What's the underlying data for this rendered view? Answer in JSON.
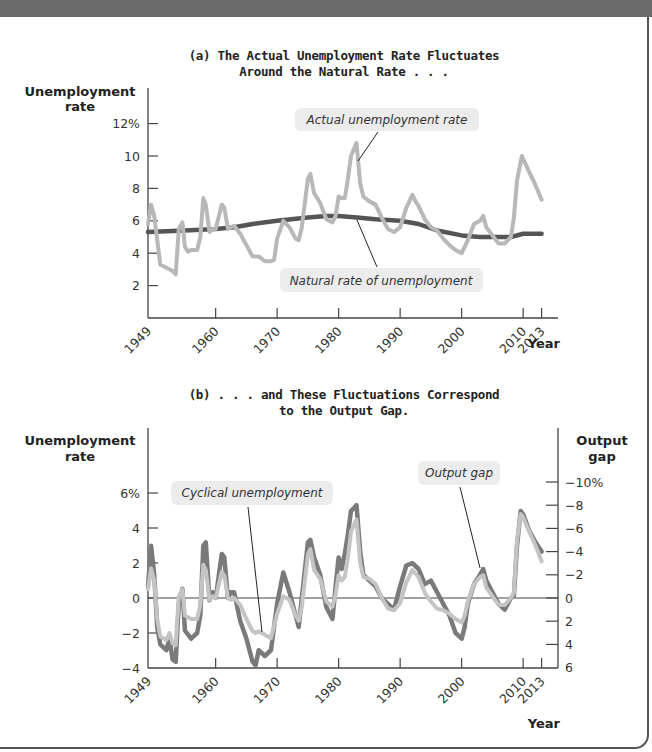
{
  "chart_data": [
    {
      "type": "line",
      "title": "(a) The Actual Unemployment Rate Fluctuates Around the Natural Rate . . .",
      "title_lines": [
        "(a) The Actual Unemployment Rate Fluctuates",
        "Around the Natural Rate . . ."
      ],
      "ylabel_lines": [
        "Unemployment",
        "rate"
      ],
      "xlabel": "Year",
      "ylim": [
        0,
        13
      ],
      "yticks": [
        {
          "v": 12,
          "label": "12%"
        },
        {
          "v": 10,
          "label": "10"
        },
        {
          "v": 8,
          "label": "8"
        },
        {
          "v": 6,
          "label": "6"
        },
        {
          "v": 4,
          "label": "4"
        },
        {
          "v": 2,
          "label": "2"
        }
      ],
      "xticks": [
        1949,
        1960,
        1970,
        1980,
        1990,
        2000,
        2010,
        2013
      ],
      "xlim": [
        1949,
        2015
      ],
      "annotations": [
        {
          "text": "Actual unemployment rate",
          "series": "actual"
        },
        {
          "text": "Natural rate of unemployment",
          "series": "natural"
        }
      ],
      "series": [
        {
          "name": "Actual unemployment rate",
          "key": "actual",
          "color": "#b8b8b8",
          "x": [
            1949,
            1949.5,
            1950,
            1950.7,
            1951,
            1952,
            1953,
            1953.5,
            1954,
            1954.6,
            1955,
            1955.5,
            1956,
            1957,
            1957.5,
            1958,
            1958.4,
            1959,
            1959.5,
            1960,
            1961,
            1961.4,
            1962,
            1962.5,
            1963,
            1964,
            1965,
            1966,
            1967,
            1968,
            1969,
            1969.5,
            1970,
            1971,
            1972,
            1973,
            1973.5,
            1974,
            1975,
            1975.4,
            1976,
            1977,
            1978,
            1979,
            1979.5,
            1980,
            1980.5,
            1981,
            1981.5,
            1982,
            1982.9,
            1983.5,
            1984,
            1985,
            1986,
            1987,
            1988,
            1989,
            1990,
            1991,
            1992,
            1992.5,
            1993,
            1994,
            1995,
            1996,
            1997,
            1998,
            1999,
            2000,
            2001,
            2002,
            2003,
            2003.5,
            2004,
            2005,
            2006,
            2007,
            2008,
            2008.5,
            2009,
            2009.8,
            2010,
            2011,
            2012,
            2013
          ],
          "y": [
            5.8,
            7.0,
            6.3,
            4.2,
            3.3,
            3.1,
            2.9,
            2.7,
            5.5,
            5.9,
            4.4,
            4.1,
            4.2,
            4.2,
            5.0,
            7.4,
            7.0,
            5.3,
            5.5,
            5.5,
            7.0,
            6.8,
            5.5,
            5.6,
            5.7,
            5.2,
            4.5,
            3.8,
            3.8,
            3.5,
            3.5,
            3.6,
            4.9,
            6.0,
            5.6,
            4.9,
            4.8,
            5.6,
            8.6,
            8.9,
            7.7,
            7.1,
            6.1,
            5.9,
            6.3,
            7.5,
            7.4,
            7.4,
            8.6,
            10.0,
            10.8,
            8.3,
            7.5,
            7.2,
            7.0,
            6.2,
            5.5,
            5.3,
            5.6,
            6.8,
            7.6,
            7.2,
            6.9,
            6.1,
            5.6,
            5.4,
            4.9,
            4.5,
            4.2,
            4.0,
            4.8,
            5.8,
            6.0,
            6.3,
            5.6,
            5.1,
            4.6,
            4.6,
            5.0,
            6.2,
            8.5,
            10.0,
            9.8,
            9.0,
            8.2,
            7.3
          ]
        },
        {
          "name": "Natural rate of unemployment",
          "key": "natural",
          "color": "#555555",
          "x": [
            1949,
            1955,
            1960,
            1963,
            1966,
            1970,
            1975,
            1978,
            1980,
            1983,
            1986,
            1990,
            1993,
            1996,
            2000,
            2003,
            2006,
            2008,
            2010,
            2013
          ],
          "y": [
            5.3,
            5.4,
            5.5,
            5.6,
            5.8,
            6.0,
            6.2,
            6.3,
            6.3,
            6.2,
            6.1,
            6.0,
            5.8,
            5.4,
            5.1,
            5.0,
            5.0,
            5.0,
            5.2,
            5.2
          ]
        }
      ]
    },
    {
      "type": "line",
      "title": "(b) . . . and These Fluctuations Correspond to the Output Gap.",
      "title_lines": [
        "(b) . . . and These Fluctuations Correspond",
        "to the Output Gap."
      ],
      "ylabel_lines": [
        "Unemployment",
        "rate"
      ],
      "y2label_lines": [
        "Output",
        "gap"
      ],
      "xlabel": "Year",
      "ylim": [
        -4,
        6
      ],
      "y2lim": [
        6,
        -10
      ],
      "yticks": [
        {
          "v": 6,
          "label": "6%"
        },
        {
          "v": 4,
          "label": "4"
        },
        {
          "v": 2,
          "label": "2"
        },
        {
          "v": 0,
          "label": "0"
        },
        {
          "v": -2,
          "label": "−2"
        },
        {
          "v": -4,
          "label": "−4"
        }
      ],
      "y2ticks": [
        {
          "v": -10,
          "label": "−10%"
        },
        {
          "v": -8,
          "label": "−8"
        },
        {
          "v": -6,
          "label": "−6"
        },
        {
          "v": -4,
          "label": "−4"
        },
        {
          "v": -2,
          "label": "−2"
        },
        {
          "v": 0,
          "label": "0"
        },
        {
          "v": 2,
          "label": "2"
        },
        {
          "v": 4,
          "label": "4"
        },
        {
          "v": 6,
          "label": "6"
        }
      ],
      "xticks": [
        1949,
        1960,
        1970,
        1980,
        1990,
        2000,
        2010,
        2013
      ],
      "xlim": [
        1949,
        2015
      ],
      "annotations": [
        {
          "text": "Cyclical unemployment",
          "series": "cyclical"
        },
        {
          "text": "Output gap",
          "series": "output_gap"
        }
      ],
      "series": [
        {
          "name": "Output gap",
          "key": "output_gap",
          "axis": "right",
          "color": "#7a7a7a",
          "x": [
            1949,
            1949.5,
            1950,
            1950.5,
            1951,
            1952,
            1952.5,
            1953,
            1953.5,
            1954,
            1954.6,
            1955,
            1956,
            1957,
            1957.5,
            1958,
            1958.4,
            1959,
            1959.5,
            1960,
            1961,
            1961.4,
            1962,
            1962.5,
            1963,
            1964,
            1965,
            1966,
            1966.5,
            1967,
            1968,
            1969,
            1970,
            1971,
            1972,
            1973,
            1973.5,
            1974,
            1975,
            1975.4,
            1976,
            1977,
            1978,
            1979,
            1979.5,
            1980,
            1980.5,
            1981,
            1981.5,
            1982,
            1982.9,
            1983.5,
            1984,
            1985,
            1986,
            1987,
            1988,
            1989,
            1990,
            1991,
            1992,
            1993,
            1994,
            1995,
            1996,
            1997,
            1998,
            1999,
            2000,
            2000.5,
            2001,
            2002,
            2003,
            2003.5,
            2004,
            2005,
            2006,
            2007,
            2008,
            2008.5,
            2009,
            2009.6,
            2010,
            2011,
            2012,
            2013
          ],
          "y": [
            -1,
            -4.5,
            -2,
            2.5,
            4,
            4.5,
            3.5,
            5.3,
            5.5,
            0.5,
            -0.8,
            2.8,
            3.5,
            3.0,
            1.5,
            -4.5,
            -4.8,
            0.2,
            -0.5,
            0,
            -3.8,
            -3.5,
            0,
            -0.5,
            -0.5,
            2.0,
            3.5,
            5.5,
            5.8,
            4.5,
            5.0,
            4.5,
            0.5,
            -2.2,
            -0.5,
            1.5,
            2.5,
            0,
            -4.8,
            -5.0,
            -3.5,
            -2.0,
            0.8,
            1.8,
            -1.0,
            -3.5,
            -2.5,
            -3.8,
            -5.5,
            -7.5,
            -8.0,
            -4.0,
            -2.0,
            -1.5,
            -1.0,
            0,
            0.5,
            1.0,
            -1.0,
            -2.8,
            -3.0,
            -2.5,
            -1.2,
            -1.5,
            -0.5,
            0.5,
            1.5,
            3.0,
            3.5,
            2.5,
            0.5,
            -1.2,
            -2.0,
            -2.5,
            -1.5,
            -0.5,
            0.5,
            1.0,
            0,
            -0.2,
            -4.5,
            -7.5,
            -7.2,
            -5.8,
            -4.8,
            -4.0
          ]
        },
        {
          "name": "Cyclical unemployment",
          "key": "cyclical",
          "axis": "left",
          "color": "#c4c4c4",
          "x": [
            1949,
            1949.5,
            1950,
            1950.5,
            1951,
            1952,
            1952.5,
            1953,
            1953.5,
            1954,
            1954.6,
            1955,
            1956,
            1957,
            1957.5,
            1958,
            1958.4,
            1959,
            1959.5,
            1960,
            1961,
            1961.4,
            1962,
            1962.5,
            1963,
            1964,
            1965,
            1966,
            1966.5,
            1967,
            1968,
            1969,
            1970,
            1971,
            1972,
            1973,
            1973.5,
            1974,
            1975,
            1975.4,
            1976,
            1977,
            1978,
            1979,
            1979.5,
            1980,
            1980.5,
            1981,
            1981.5,
            1982,
            1982.9,
            1983.5,
            1984,
            1985,
            1986,
            1987,
            1988,
            1989,
            1990,
            1991,
            1992,
            1993,
            1994,
            1995,
            1996,
            1997,
            1998,
            1999,
            2000,
            2000.5,
            2001,
            2002,
            2003,
            2003.5,
            2004,
            2005,
            2006,
            2007,
            2008,
            2008.5,
            2009,
            2009.6,
            2010,
            2011,
            2012,
            2013
          ],
          "y": [
            0.5,
            1.7,
            1.0,
            -1.2,
            -2.2,
            -2.4,
            -2.0,
            -2.6,
            -2.7,
            0.1,
            0.5,
            -1.0,
            -1.2,
            -1.2,
            -0.4,
            1.9,
            1.6,
            -0.1,
            0.1,
            0,
            1.5,
            1.3,
            0,
            -0.1,
            0,
            -0.4,
            -1.2,
            -1.9,
            -2.0,
            -1.9,
            -2.1,
            -2.3,
            -0.9,
            0.1,
            -0.1,
            -1.0,
            -1.3,
            -0.5,
            2.5,
            2.8,
            1.6,
            1.1,
            -0.2,
            -0.5,
            0.2,
            1.3,
            1.0,
            1.2,
            2.3,
            3.8,
            4.5,
            2.0,
            1.2,
            1.1,
            0.8,
            0,
            -0.6,
            -0.7,
            -0.3,
            0.9,
            1.6,
            1.2,
            0.3,
            -0.2,
            -0.6,
            -0.7,
            -0.9,
            -1.2,
            -1.4,
            -1.0,
            -0.2,
            0.8,
            1.2,
            1.3,
            0.6,
            0.1,
            -0.4,
            -0.4,
            0,
            0.3,
            3.3,
            4.8,
            4.6,
            3.8,
            3.0,
            2.1
          ]
        }
      ]
    }
  ]
}
